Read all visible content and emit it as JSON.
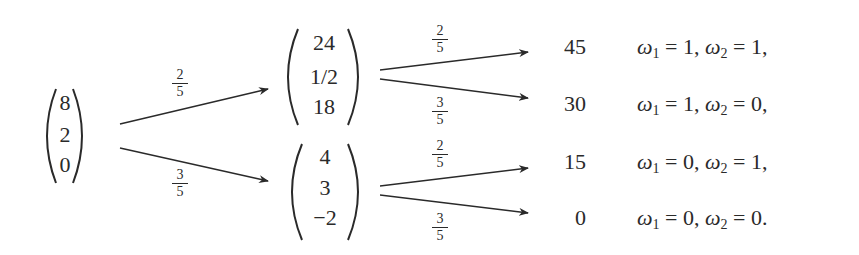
{
  "diagram": {
    "type": "probability-tree",
    "root": {
      "vector": [
        "8",
        "2",
        "0"
      ]
    },
    "level1": [
      {
        "prob_num": "2",
        "prob_den": "5",
        "vector": [
          "24",
          "1/2",
          "18"
        ]
      },
      {
        "prob_num": "3",
        "prob_den": "5",
        "vector": [
          "4",
          "3",
          "−2"
        ]
      }
    ],
    "level2": [
      {
        "prob_num": "2",
        "prob_den": "5",
        "value": "45",
        "w1": "1",
        "w2": "1",
        "end": ","
      },
      {
        "prob_num": "3",
        "prob_den": "5",
        "value": "30",
        "w1": "1",
        "w2": "0",
        "end": ","
      },
      {
        "prob_num": "2",
        "prob_den": "5",
        "value": "15",
        "w1": "0",
        "w2": "1",
        "end": ","
      },
      {
        "prob_num": "3",
        "prob_den": "5",
        "value": "0",
        "w1": "0",
        "w2": "0",
        "end": "."
      }
    ],
    "symbols": {
      "omega": "ω",
      "sub1": "1",
      "sub2": "2",
      "eq": " = ",
      "sep": ", "
    },
    "colors": {
      "ink": "#2a2a2a",
      "background": "#ffffff"
    }
  }
}
